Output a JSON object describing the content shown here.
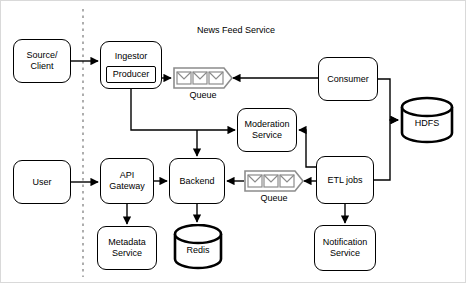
{
  "diagram": {
    "title": "News Feed Service",
    "boundary": {
      "name": "trust-boundary",
      "style": "dashed-vertical"
    },
    "nodes": [
      {
        "id": "source-client",
        "label": "Source/\nClient",
        "shape": "rounded-box",
        "x": 12,
        "y": 38,
        "w": 58,
        "h": 44
      },
      {
        "id": "ingestor",
        "label": "Ingestor",
        "shape": "rounded-box",
        "x": 99,
        "y": 40,
        "w": 62,
        "h": 48,
        "inner_label": "Producer"
      },
      {
        "id": "consumer",
        "label": "Consumer",
        "shape": "rounded-box",
        "x": 317,
        "y": 56,
        "w": 60,
        "h": 44
      },
      {
        "id": "hdfs",
        "label": "HDFS",
        "shape": "cylinder",
        "x": 399,
        "y": 95,
        "w": 54,
        "h": 48
      },
      {
        "id": "moderation-service",
        "label": "Moderation\nService",
        "shape": "rounded-box",
        "x": 236,
        "y": 107,
        "w": 60,
        "h": 44
      },
      {
        "id": "user",
        "label": "User",
        "shape": "rounded-box",
        "x": 12,
        "y": 159,
        "w": 58,
        "h": 44
      },
      {
        "id": "api-gateway",
        "label": "API\nGateway",
        "shape": "rounded-box",
        "x": 99,
        "y": 157,
        "w": 54,
        "h": 46
      },
      {
        "id": "backend",
        "label": "Backend",
        "shape": "rounded-box",
        "x": 168,
        "y": 157,
        "w": 56,
        "h": 46
      },
      {
        "id": "etl-jobs",
        "label": "ETL jobs",
        "shape": "rounded-box",
        "x": 315,
        "y": 155,
        "w": 58,
        "h": 48
      },
      {
        "id": "metadata-service",
        "label": "Metadata\nService",
        "shape": "rounded-box",
        "x": 96,
        "y": 225,
        "w": 60,
        "h": 44
      },
      {
        "id": "redis",
        "label": "Redis",
        "shape": "cylinder",
        "x": 172,
        "y": 223,
        "w": 50,
        "h": 46
      },
      {
        "id": "notification-service",
        "label": "Notification\nService",
        "shape": "rounded-box",
        "x": 313,
        "y": 224,
        "w": 62,
        "h": 46
      }
    ],
    "queues": [
      {
        "id": "queue-top",
        "caption": "Queue",
        "x": 172,
        "y": 66,
        "messages": 3
      },
      {
        "id": "queue-bottom",
        "caption": "Queue",
        "x": 243,
        "y": 169,
        "messages": 3
      }
    ],
    "colors": {
      "stroke": "#000000",
      "queue_stroke": "#808080",
      "boundary": "#999999",
      "background": "#ffffff",
      "canvas_border": "#d9d9d9"
    },
    "edges": [
      {
        "from": "source-client",
        "to": "ingestor"
      },
      {
        "from": "ingestor-producer",
        "to": "queue-top"
      },
      {
        "from": "queue-top",
        "to": "consumer",
        "direction": "consumer-pulls"
      },
      {
        "from": "ingestor-producer",
        "to": "moderation-service"
      },
      {
        "from": "ingestor-producer",
        "to": "backend"
      },
      {
        "from": "consumer",
        "to": "hdfs"
      },
      {
        "from": "etl-jobs",
        "to": "hdfs"
      },
      {
        "from": "etl-jobs",
        "to": "moderation-service"
      },
      {
        "from": "etl-jobs",
        "to": "queue-bottom"
      },
      {
        "from": "queue-bottom",
        "to": "backend"
      },
      {
        "from": "etl-jobs",
        "to": "notification-service"
      },
      {
        "from": "user",
        "to": "api-gateway"
      },
      {
        "from": "api-gateway",
        "to": "backend"
      },
      {
        "from": "api-gateway",
        "to": "metadata-service"
      },
      {
        "from": "backend",
        "to": "redis"
      }
    ]
  }
}
